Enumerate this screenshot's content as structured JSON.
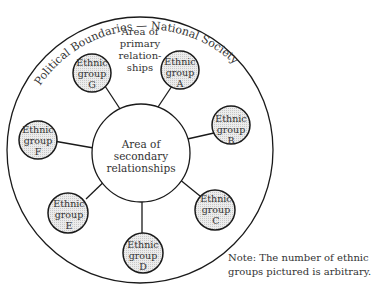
{
  "diagram": {
    "outer_label": "Political Boundaries — National Society",
    "primary_area": [
      "Area of",
      "primary",
      "relation-",
      "ships"
    ],
    "secondary_area": [
      "Area of",
      "secondary",
      "relationships"
    ],
    "groups": [
      {
        "id": "A",
        "line1": "Ethnic",
        "line2": "group",
        "line3": "A"
      },
      {
        "id": "B",
        "line1": "Ethnic",
        "line2": "group",
        "line3": "B"
      },
      {
        "id": "C",
        "line1": "Ethnic",
        "line2": "group",
        "line3": "C"
      },
      {
        "id": "D",
        "line1": "Ethnic",
        "line2": "group",
        "line3": "D"
      },
      {
        "id": "E",
        "line1": "Ethnic",
        "line2": "group",
        "line3": "E"
      },
      {
        "id": "F",
        "line1": "Ethnic",
        "line2": "group",
        "line3": "F"
      },
      {
        "id": "G",
        "line1": "Ethnic",
        "line2": "group",
        "line3": "G"
      }
    ],
    "note": "Note: The number of ethnic groups pictured is arbitrary.",
    "colors": {
      "stroke": "#1a1a1a",
      "group_fill": "#e4e4e4"
    }
  }
}
